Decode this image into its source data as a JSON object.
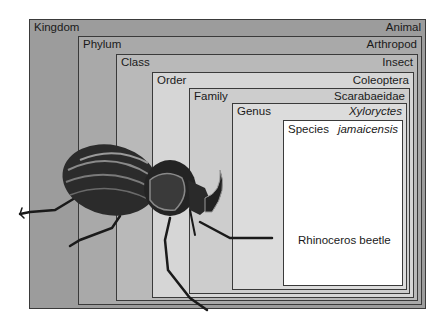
{
  "diagram": {
    "levels": [
      {
        "rank": "Kingdom",
        "name": "Animal",
        "italic": false,
        "fill": "#9c9c9c"
      },
      {
        "rank": "Phylum",
        "name": "Arthropod",
        "italic": false,
        "fill": "#ababab"
      },
      {
        "rank": "Class",
        "name": "Insect",
        "italic": false,
        "fill": "#bababa"
      },
      {
        "rank": "Order",
        "name": "Coleoptera",
        "italic": false,
        "fill": "#d8d8d8"
      },
      {
        "rank": "Family",
        "name": "Scarabaeidae",
        "italic": false,
        "fill": "#cfcfcf"
      },
      {
        "rank": "Genus",
        "name": "Xyloryctes",
        "italic": true,
        "fill": "#dedede"
      },
      {
        "rank": "Species",
        "name": "jamaicensis",
        "italic": true,
        "fill": "#ffffff"
      }
    ],
    "common_name": "Rhinoceros beetle",
    "illustration": "rhinoceros-beetle-drawing"
  }
}
